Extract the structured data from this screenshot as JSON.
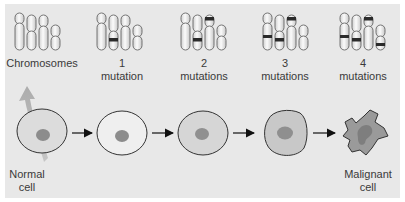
{
  "diagram": {
    "title_stages": [
      {
        "id": "chromosomes",
        "line1": "Chromosomes",
        "line2": ""
      },
      {
        "id": "mutation-1",
        "line1": "1",
        "line2": "mutation"
      },
      {
        "id": "mutation-2",
        "line1": "2",
        "line2": "mutations"
      },
      {
        "id": "mutation-3",
        "line1": "3",
        "line2": "mutations"
      },
      {
        "id": "mutation-4",
        "line1": "4",
        "line2": "mutations"
      }
    ],
    "cells": [
      {
        "id": "normal",
        "line1": "Normal",
        "line2": "cell"
      },
      {
        "id": "malignant",
        "line1": "Malignant",
        "line2": "cell"
      }
    ],
    "colors": {
      "background": "#e8e8e8",
      "chromosome_fill": "#f2f2f2",
      "band": "#2b2b2b",
      "cell_fill_1": "#dcdcdc",
      "cell_fill_2": "#efefef",
      "cell_fill_3": "#d6d6d6",
      "cell_fill_4": "#c8c8c8",
      "cell_fill_5": "#9a9a9a",
      "nucleus": "#8c8c8c",
      "arrow": "#111111"
    }
  }
}
